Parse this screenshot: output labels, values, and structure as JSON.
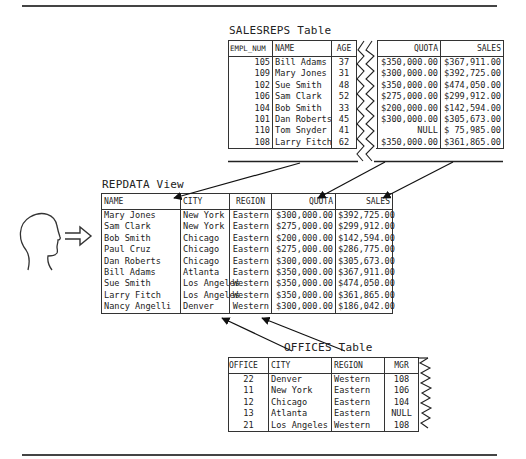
{
  "salesreps": {
    "title": "SALESREPS Table",
    "columns": [
      "EMPL_NUM",
      "NAME",
      "AGE",
      "QUOTA",
      "SALES"
    ],
    "rows": [
      {
        "empl_num": "105",
        "name": "Bill Adams",
        "age": "37",
        "quota": "$350,000.00",
        "sales": "$367,911.00"
      },
      {
        "empl_num": "109",
        "name": "Mary Jones",
        "age": "31",
        "quota": "$300,000.00",
        "sales": "$392,725.00"
      },
      {
        "empl_num": "102",
        "name": "Sue Smith",
        "age": "48",
        "quota": "$350,000.00",
        "sales": "$474,050.00"
      },
      {
        "empl_num": "106",
        "name": "Sam Clark",
        "age": "52",
        "quota": "$275,000.00",
        "sales": "$299,912.00"
      },
      {
        "empl_num": "104",
        "name": "Bob Smith",
        "age": "33",
        "quota": "$200,000.00",
        "sales": "$142,594.00"
      },
      {
        "empl_num": "101",
        "name": "Dan Roberts",
        "age": "45",
        "quota": "$300,000.00",
        "sales": "$305,673.00"
      },
      {
        "empl_num": "110",
        "name": "Tom Snyder",
        "age": "41",
        "quota": "NULL",
        "sales": "$ 75,985.00"
      },
      {
        "empl_num": "108",
        "name": "Larry Fitch",
        "age": "62",
        "quota": "$350,000.00",
        "sales": "$361,865.00"
      }
    ]
  },
  "repdata": {
    "title": "REPDATA View",
    "columns": [
      "NAME",
      "CITY",
      "REGION",
      "QUOTA",
      "SALES"
    ],
    "rows": [
      {
        "name": "Mary Jones",
        "city": "New York",
        "region": "Eastern",
        "quota": "$300,000.00",
        "sales": "$392,725.00"
      },
      {
        "name": "Sam Clark",
        "city": "New York",
        "region": "Eastern",
        "quota": "$275,000.00",
        "sales": "$299,912.00"
      },
      {
        "name": "Bob Smith",
        "city": "Chicago",
        "region": "Eastern",
        "quota": "$200,000.00",
        "sales": "$142,594.00"
      },
      {
        "name": "Paul Cruz",
        "city": "Chicago",
        "region": "Eastern",
        "quota": "$275,000.00",
        "sales": "$286,775.00"
      },
      {
        "name": "Dan Roberts",
        "city": "Chicago",
        "region": "Eastern",
        "quota": "$300,000.00",
        "sales": "$305,673.00"
      },
      {
        "name": "Bill Adams",
        "city": "Atlanta",
        "region": "Eastern",
        "quota": "$350,000.00",
        "sales": "$367,911.00"
      },
      {
        "name": "Sue Smith",
        "city": "Los Angeles",
        "region": "Western",
        "quota": "$350,000.00",
        "sales": "$474,050.00"
      },
      {
        "name": "Larry Fitch",
        "city": "Los Angeles",
        "region": "Western",
        "quota": "$350,000.00",
        "sales": "$361,865.00"
      },
      {
        "name": "Nancy Angelli",
        "city": "Denver",
        "region": "Western",
        "quota": "$300,000.00",
        "sales": "$186,042.00"
      }
    ]
  },
  "offices": {
    "title": "OFFICES Table",
    "columns": [
      "OFFICE",
      "CITY",
      "REGION",
      "MGR"
    ],
    "rows": [
      {
        "office": "22",
        "city": "Denver",
        "region": "Western",
        "mgr": "108"
      },
      {
        "office": "11",
        "city": "New York",
        "region": "Eastern",
        "mgr": "106"
      },
      {
        "office": "12",
        "city": "Chicago",
        "region": "Eastern",
        "mgr": "104"
      },
      {
        "office": "13",
        "city": "Atlanta",
        "region": "Eastern",
        "mgr": "NULL"
      },
      {
        "office": "21",
        "city": "Los Angeles",
        "region": "Western",
        "mgr": "108"
      }
    ]
  },
  "icons": {
    "user": "person-head-silhouette",
    "arrow": "double-line-right-arrow"
  },
  "colors": {
    "ink": "#222222",
    "rule": "#444444",
    "background": "#ffffff"
  }
}
